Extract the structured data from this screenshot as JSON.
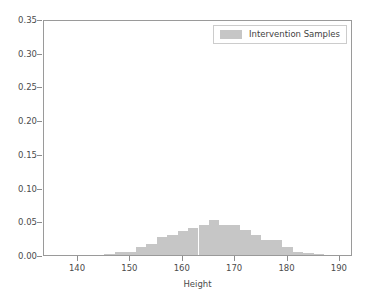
{
  "chart_data": {
    "type": "bar",
    "title": "",
    "xlabel": "Height",
    "ylabel": "",
    "xlim": [
      133.5,
      192.5
    ],
    "ylim": [
      0.0,
      0.35
    ],
    "grid": false,
    "bin_width": 2.0,
    "legend": {
      "position": "upper right",
      "entries": [
        {
          "name": "Intervention Samples",
          "color": "#c6c6c6"
        }
      ]
    },
    "xticks": [
      140,
      150,
      160,
      170,
      180,
      190
    ],
    "xticklabels": [
      "140",
      "150",
      "160",
      "170",
      "180",
      "190"
    ],
    "yticks": [
      0.0,
      0.05,
      0.1,
      0.15,
      0.2,
      0.25,
      0.3,
      0.35
    ],
    "yticklabels": [
      "0.00",
      "0.05",
      "0.10",
      "0.15",
      "0.20",
      "0.25",
      "0.30",
      "0.35"
    ],
    "series": [
      {
        "name": "Intervention Samples",
        "color": "#c6c6c6",
        "bin_edges": [
          145,
          147,
          149,
          151,
          153,
          155,
          157,
          159,
          161,
          163,
          165,
          167,
          169,
          171,
          173,
          175,
          177,
          179,
          181,
          183,
          185,
          187
        ],
        "x": [
          146,
          148,
          150,
          152,
          154,
          156,
          158,
          160,
          162,
          164,
          166,
          168,
          170,
          172,
          174,
          176,
          178,
          180,
          182,
          184,
          186
        ],
        "values": [
          0.002,
          0.004,
          0.005,
          0.012,
          0.017,
          0.026,
          0.03,
          0.036,
          0.04,
          0.045,
          0.052,
          0.044,
          0.044,
          0.037,
          0.03,
          0.023,
          0.022,
          0.012,
          0.004,
          0.003,
          0.002
        ]
      }
    ]
  },
  "axis": {
    "xlabel": "Height"
  },
  "legend": {
    "label": "Intervention Samples"
  }
}
